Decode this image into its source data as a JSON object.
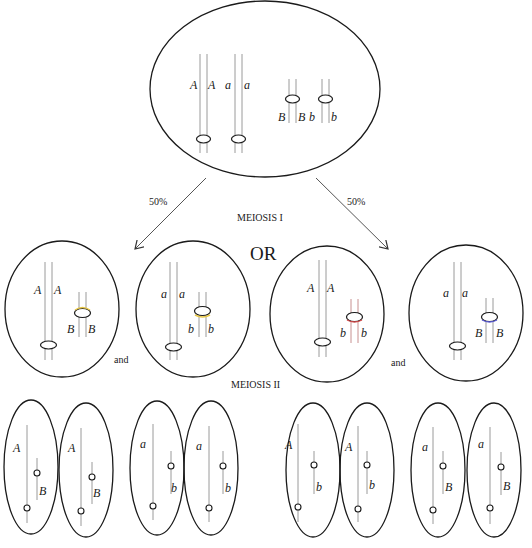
{
  "figure": {
    "labels": {
      "meiosis1": "MEIOSIS I",
      "meiosis2": "MEIOSIS II",
      "or": "OR",
      "and_left": "and",
      "and_right": "and",
      "pct_left": "50%",
      "pct_right": "50%"
    },
    "colors": {
      "cell_outline": "#1a1a1a",
      "chromatid": "#9a9a9a",
      "centromere_yellow": "#e8c84a",
      "centromere_red": "#d04a4a",
      "centromere_blue": "#5a5ad0"
    },
    "parent_cell": {
      "alleles": {
        "A1": "A",
        "A2": "A",
        "a1": "a",
        "a2": "a",
        "B1": "B",
        "B2": "B",
        "b1": "b",
        "b2": "b"
      }
    },
    "meiosis1_cells": [
      {
        "long": [
          "A",
          "A"
        ],
        "short": [
          "B",
          "B"
        ],
        "centromere_color": "#e8c84a"
      },
      {
        "long": [
          "a",
          "a"
        ],
        "short": [
          "b",
          "b"
        ],
        "centromere_color": "#e8c84a"
      },
      {
        "long": [
          "A",
          "A"
        ],
        "short": [
          "b",
          "b"
        ],
        "centromere_color": "#d04a4a"
      },
      {
        "long": [
          "a",
          "a"
        ],
        "short": [
          "B",
          "B"
        ],
        "centromere_color": "#5a5ad0"
      }
    ],
    "gametes": [
      {
        "long": "A",
        "short": "B"
      },
      {
        "long": "A",
        "short": "B"
      },
      {
        "long": "a",
        "short": "b"
      },
      {
        "long": "a",
        "short": "b"
      },
      {
        "long": "A",
        "short": "b"
      },
      {
        "long": "A",
        "short": "b"
      },
      {
        "long": "a",
        "short": "B"
      },
      {
        "long": "a",
        "short": "B"
      }
    ]
  }
}
